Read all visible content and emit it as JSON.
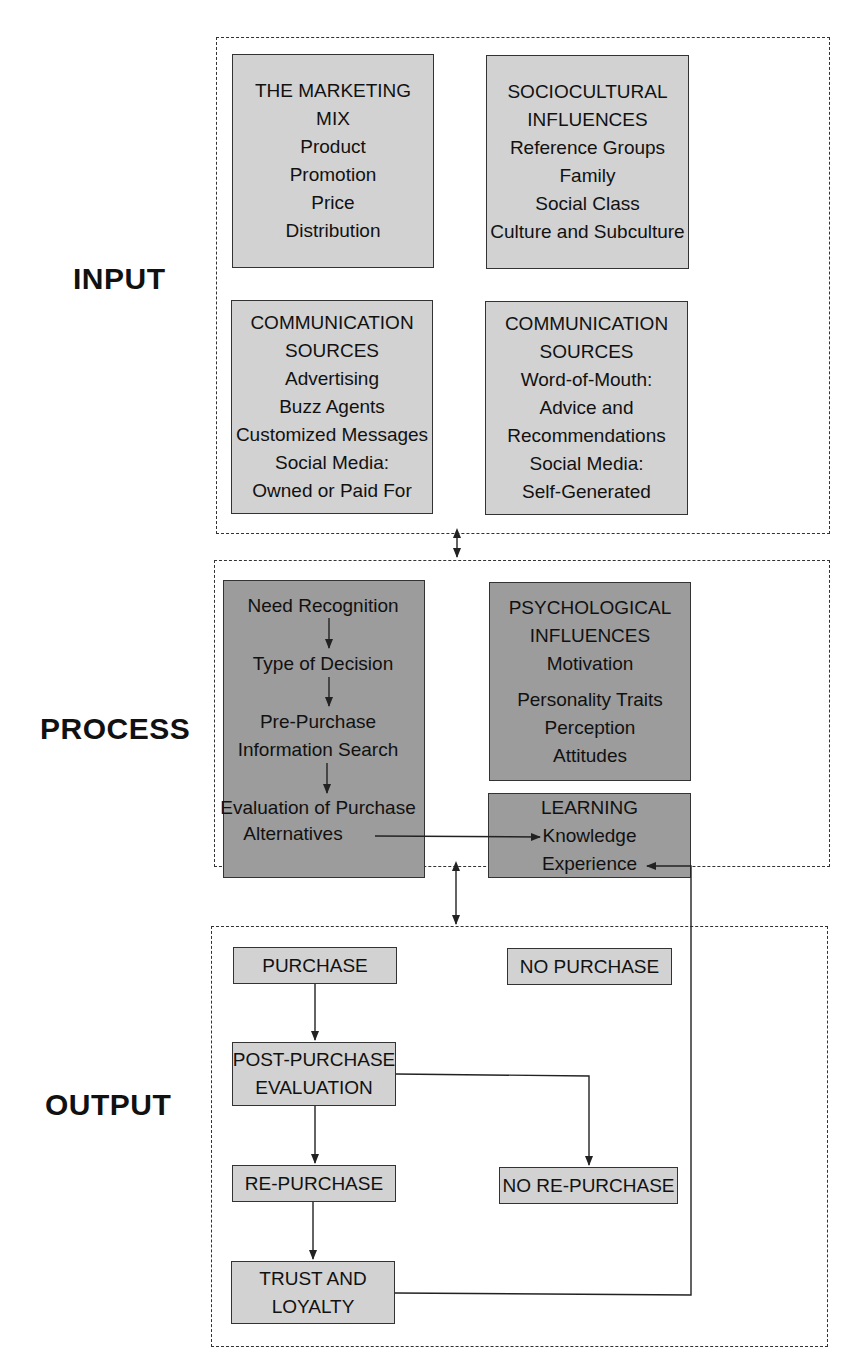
{
  "stages": {
    "input": "INPUT",
    "process": "PROCESS",
    "output": "OUTPUT"
  },
  "input": {
    "marketing_mix": {
      "title": [
        "THE MARKETING",
        "MIX"
      ],
      "items": [
        "Product",
        "Promotion",
        "Price",
        "Distribution"
      ]
    },
    "sociocultural": {
      "title": [
        "SOCIOCULTURAL",
        "INFLUENCES"
      ],
      "items": [
        "Reference Groups",
        "Family",
        "Social Class",
        "Culture and Subculture"
      ]
    },
    "comm_sources_1": {
      "title": [
        "COMMUNICATION",
        "SOURCES"
      ],
      "items": [
        "Advertising",
        "Buzz Agents",
        "Customized Messages",
        "Social Media:",
        "Owned or Paid For"
      ]
    },
    "comm_sources_2": {
      "title": [
        "COMMUNICATION",
        "SOURCES"
      ],
      "items": [
        "Word-of-Mouth:",
        "Advice and",
        "Recommendations",
        "Social Media:",
        "Self-Generated"
      ]
    }
  },
  "process": {
    "decision_steps": [
      "Need Recognition",
      "Type of Decision",
      "Pre-Purchase",
      "Information Search",
      "Evaluation of Purchase",
      "Alternatives"
    ],
    "psychological": {
      "title": [
        "PSYCHOLOGICAL",
        "INFLUENCES"
      ],
      "items": [
        "Motivation",
        "Personality Traits",
        "Perception",
        "Attitudes"
      ]
    },
    "learning": {
      "title": "LEARNING",
      "items": [
        "Knowledge",
        "Experience"
      ]
    }
  },
  "output": {
    "purchase": "PURCHASE",
    "no_purchase": "NO PURCHASE",
    "post_purchase": [
      "POST-PURCHASE",
      "EVALUATION"
    ],
    "repurchase": "RE-PURCHASE",
    "no_repurchase": "NO RE-PURCHASE",
    "trust": [
      "TRUST AND",
      "LOYALTY"
    ]
  },
  "colors": {
    "light_box": "#d2d2d2",
    "dark_box": "#9c9c9c",
    "line": "#333333"
  }
}
